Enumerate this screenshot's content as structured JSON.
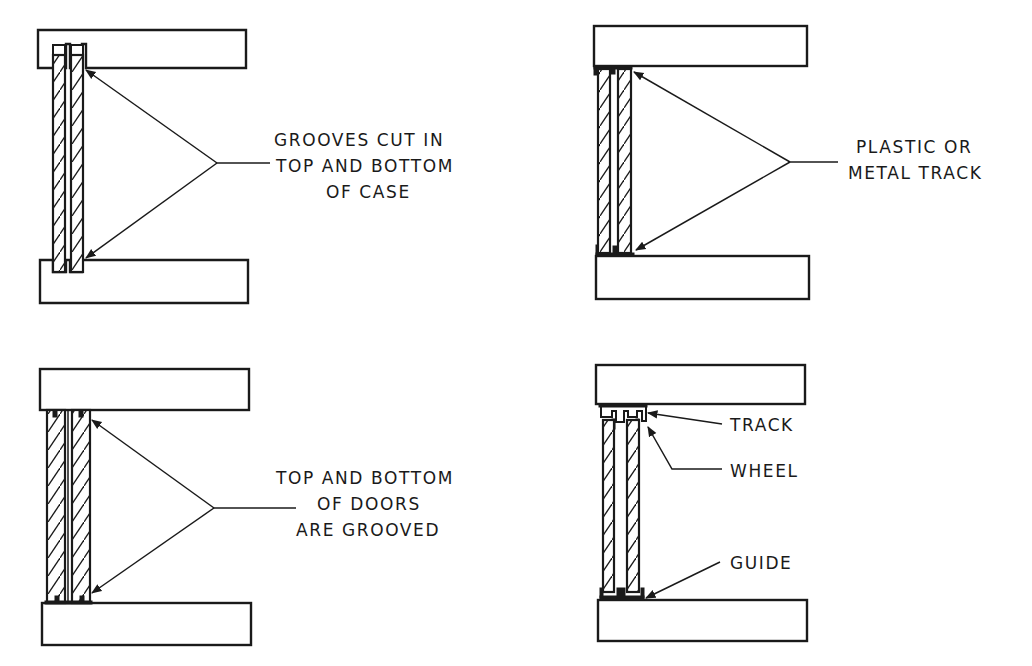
{
  "diagram": {
    "panels": [
      {
        "id": "grooved-case",
        "label_lines": [
          "GROOVES CUT IN",
          "TOP AND BOTTOM",
          "OF CASE"
        ]
      },
      {
        "id": "plastic-metal-track",
        "label_lines": [
          "PLASTIC OR",
          "METAL TRACK"
        ]
      },
      {
        "id": "grooved-doors",
        "label_lines": [
          "TOP AND BOTTOM",
          "OF DOORS",
          "ARE GROOVED"
        ]
      },
      {
        "id": "track-wheel-guide",
        "labels": {
          "track": "TRACK",
          "wheel": "WHEEL",
          "guide": "GUIDE"
        }
      }
    ],
    "colors": {
      "ink": "#1a1a1a",
      "paper": "#ffffff"
    }
  }
}
